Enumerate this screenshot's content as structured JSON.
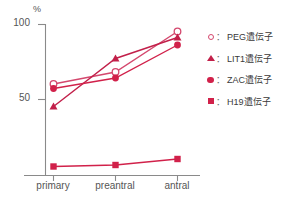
{
  "chart_data": {
    "type": "line",
    "title": "",
    "subtitle": "",
    "xlabel": "",
    "ylabel": "%",
    "categories": [
      "primary",
      "preantral",
      "antral"
    ],
    "ylim": [
      0,
      100
    ],
    "ytick_values": [
      50,
      100
    ],
    "ytick_labels": [
      "50",
      "100"
    ],
    "grid": false,
    "legend_position": "right",
    "series": [
      {
        "name": "PEG遺伝子",
        "marker": "circle-open",
        "color": "#d4486e",
        "values": [
          60,
          68,
          95
        ]
      },
      {
        "name": "LIT1遺伝子",
        "marker": "triangle-filled",
        "color": "#c2204a",
        "values": [
          45,
          77,
          91
        ]
      },
      {
        "name": "ZAC遺伝子",
        "marker": "circle-filled",
        "color": "#d1214a",
        "values": [
          57,
          64,
          86
        ]
      },
      {
        "name": "H19遺伝子",
        "marker": "square-filled",
        "color": "#d1214a",
        "values": [
          5,
          6,
          10
        ]
      }
    ]
  },
  "axes": {
    "unit_label": "%",
    "top_label": "100",
    "mid_label": "50"
  },
  "legend": {
    "separator": "：",
    "items": [
      {
        "label": "PEG遺伝子",
        "marker": "circle-open-icon"
      },
      {
        "label": "LIT1遺伝子",
        "marker": "triangle-filled-icon"
      },
      {
        "label": "ZAC遺伝子",
        "marker": "circle-filled-icon"
      },
      {
        "label": "H19遺伝子",
        "marker": "square-filled-icon"
      }
    ]
  },
  "colors": {
    "accent": "#d1214a",
    "accent_light": "#d4486e",
    "axis": "#8a8a8a",
    "text": "#555555"
  }
}
